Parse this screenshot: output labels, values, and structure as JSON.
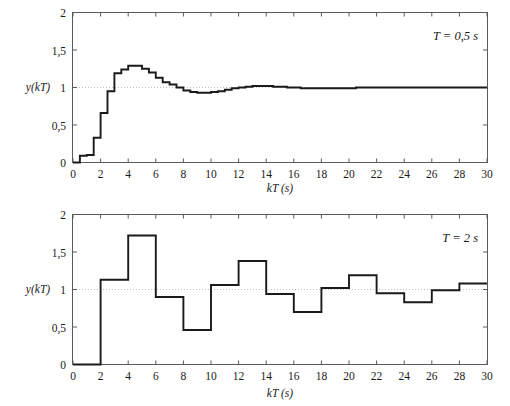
{
  "figure": {
    "background_color": "#ffffff",
    "line_color": "#1a1a1a",
    "axis_color": "#5a5a5a",
    "grid_color": "#b9b9b9"
  },
  "chart_data": [
    {
      "type": "line",
      "subtype": "step",
      "panel": "top",
      "title": "",
      "annotation": "T = 0,5 s",
      "xlabel": "kT (s)",
      "ylabel": "y(kT)",
      "xlim": [
        0,
        30
      ],
      "ylim": [
        0,
        2
      ],
      "xticks": [
        0,
        2,
        4,
        6,
        8,
        10,
        12,
        14,
        16,
        18,
        20,
        22,
        24,
        26,
        28,
        30
      ],
      "xtick_labels": [
        "0",
        "2",
        "4",
        "6",
        "8",
        "10",
        "12",
        "14",
        "16",
        "18",
        "20",
        "22",
        "24",
        "26",
        "28",
        "30"
      ],
      "yticks": [
        0,
        0.5,
        1,
        1.5,
        2
      ],
      "ytick_labels": [
        "0",
        "0,5",
        "1",
        "1,5",
        "2"
      ],
      "grid": false,
      "reference_line_y": 1,
      "sample_period": 0.5,
      "x": [
        0,
        0.5,
        1,
        1.5,
        2,
        2.5,
        3,
        3.5,
        4,
        4.5,
        5,
        5.5,
        6,
        6.5,
        7,
        7.5,
        8,
        8.5,
        9,
        9.5,
        10,
        10.5,
        11,
        11.5,
        12,
        12.5,
        13,
        13.5,
        14,
        14.5,
        15,
        15.5,
        16,
        16.5,
        17,
        17.5,
        18,
        18.5,
        19,
        19.5,
        20,
        20.5,
        21,
        21.5,
        22,
        22.5,
        23,
        23.5,
        24,
        24.5,
        25,
        25.5,
        26,
        26.5,
        27,
        27.5,
        28,
        28.5,
        29,
        29.5,
        30
      ],
      "values": [
        0,
        0.09,
        0.1,
        0.33,
        0.66,
        0.95,
        1.19,
        1.24,
        1.29,
        1.29,
        1.25,
        1.2,
        1.13,
        1.07,
        1.04,
        1.0,
        0.96,
        0.94,
        0.93,
        0.93,
        0.94,
        0.95,
        0.97,
        0.99,
        1.0,
        1.01,
        1.02,
        1.02,
        1.02,
        1.01,
        1.01,
        1.0,
        1.0,
        0.99,
        0.99,
        0.99,
        0.99,
        0.99,
        0.99,
        0.99,
        0.99,
        1.0,
        1.0,
        1.0,
        1.0,
        1.0,
        1.0,
        1.0,
        1.0,
        1.0,
        1.0,
        1.0,
        1.0,
        1.0,
        1.0,
        1.0,
        1.0,
        1.0,
        1.0,
        1.0,
        1.0
      ]
    },
    {
      "type": "line",
      "subtype": "step",
      "panel": "bottom",
      "title": "",
      "annotation": "T = 2 s",
      "xlabel": "kT (s)",
      "ylabel": "y(kT)",
      "xlim": [
        0,
        30
      ],
      "ylim": [
        0,
        2
      ],
      "xticks": [
        0,
        2,
        4,
        6,
        8,
        10,
        12,
        14,
        16,
        18,
        20,
        22,
        24,
        26,
        28,
        30
      ],
      "xtick_labels": [
        "0",
        "2",
        "4",
        "6",
        "8",
        "10",
        "12",
        "14",
        "16",
        "18",
        "20",
        "22",
        "24",
        "26",
        "28",
        "30"
      ],
      "yticks": [
        0,
        0.5,
        1,
        1.5,
        2
      ],
      "ytick_labels": [
        "0",
        "0,5",
        "1",
        "1,5",
        "2"
      ],
      "grid": false,
      "reference_line_y": 1,
      "sample_period": 2,
      "x": [
        0,
        2,
        4,
        6,
        8,
        10,
        12,
        14,
        16,
        18,
        20,
        22,
        24,
        26,
        28,
        30
      ],
      "values": [
        0,
        1.13,
        1.72,
        0.9,
        0.46,
        1.06,
        1.38,
        0.94,
        0.7,
        1.02,
        1.19,
        0.95,
        0.83,
        0.99,
        1.08,
        1.08
      ]
    }
  ]
}
